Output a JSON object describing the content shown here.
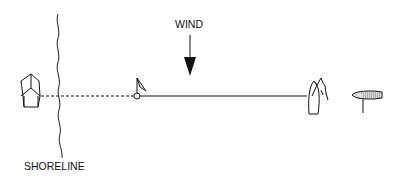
{
  "diagram": {
    "labels": {
      "wind": "WIND",
      "shoreline": "SHORELINE"
    },
    "elements": [
      {
        "name": "boat-on-shore",
        "description": "boat viewed from above, bow pointing up, on shore"
      },
      {
        "name": "shoreline",
        "description": "wavy vertical line"
      },
      {
        "name": "buoy-with-flag",
        "description": "small circle marker with flag"
      },
      {
        "name": "sailboat-luffing",
        "description": "sailboat with flapping sails"
      },
      {
        "name": "anchored-boat",
        "description": "shaded boat with anchor line"
      }
    ],
    "colors": {
      "line": "#111111",
      "background": "#ffffff"
    }
  }
}
